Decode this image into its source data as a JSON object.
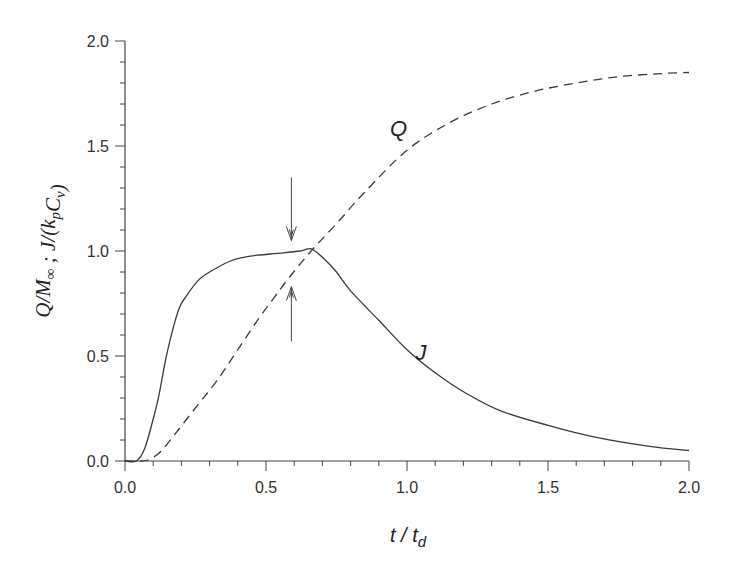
{
  "chart_data": {
    "type": "line",
    "title": "",
    "xlabel": "t / t_d",
    "xlabel_parts": {
      "main": "t / t",
      "sub": "d"
    },
    "ylabel": "Q/M∞ ; J/(k_p C_v)",
    "ylabel_parts": [
      {
        "text": "Q/M",
        "sub": "∞"
      },
      {
        "text": " ; J/(k",
        "sub": "p"
      },
      {
        "text": "C",
        "sub": "v"
      },
      {
        "text": ")",
        "sub": ""
      }
    ],
    "xlim": [
      0.0,
      2.0
    ],
    "ylim": [
      0.0,
      2.0
    ],
    "x_ticks": [
      "0.0",
      "0.5",
      "1.0",
      "1.5",
      "2.0"
    ],
    "y_ticks": [
      "0.0",
      "0.5",
      "1.0",
      "1.5",
      "2.0"
    ],
    "x_tick_values": [
      0.0,
      0.5,
      1.0,
      1.5,
      2.0
    ],
    "y_tick_values": [
      0.0,
      0.5,
      1.0,
      1.5,
      2.0
    ],
    "minor_step": 0.1,
    "grid": false,
    "legend": "none",
    "series": [
      {
        "name": "J",
        "style": "solid",
        "x": [
          0.0,
          0.04,
          0.07,
          0.1,
          0.12,
          0.15,
          0.19,
          0.22,
          0.26,
          0.3,
          0.37,
          0.42,
          0.47,
          0.55,
          0.62,
          0.66,
          0.7,
          0.75,
          0.8,
          0.9,
          1.0,
          1.1,
          1.2,
          1.33,
          1.5,
          1.68,
          1.86,
          2.0
        ],
        "values": [
          0.0,
          0.0,
          0.06,
          0.2,
          0.31,
          0.52,
          0.72,
          0.79,
          0.86,
          0.9,
          0.95,
          0.97,
          0.98,
          0.99,
          1.0,
          1.01,
          0.97,
          0.9,
          0.81,
          0.67,
          0.53,
          0.42,
          0.33,
          0.24,
          0.17,
          0.11,
          0.07,
          0.05
        ]
      },
      {
        "name": "Q",
        "style": "dashed",
        "x": [
          0.0,
          0.06,
          0.09,
          0.13,
          0.19,
          0.26,
          0.33,
          0.4,
          0.47,
          0.53,
          0.58,
          0.66,
          0.75,
          0.85,
          1.0,
          1.15,
          1.3,
          1.45,
          1.6,
          1.75,
          1.9,
          2.0
        ],
        "values": [
          0.0,
          0.0,
          0.01,
          0.05,
          0.15,
          0.27,
          0.39,
          0.53,
          0.67,
          0.78,
          0.87,
          1.0,
          1.13,
          1.28,
          1.48,
          1.61,
          1.7,
          1.76,
          1.8,
          1.83,
          1.845,
          1.85
        ]
      }
    ],
    "annotations": [
      {
        "type": "label",
        "text": "Q",
        "x": 0.94,
        "y": 1.55
      },
      {
        "type": "label",
        "text": "J",
        "x": 1.03,
        "y": 0.48
      },
      {
        "type": "arrow",
        "direction": "down",
        "x": 0.59,
        "from": 1.35,
        "to": 1.05
      },
      {
        "type": "arrow",
        "direction": "up",
        "x": 0.59,
        "from": 0.57,
        "to": 0.83
      }
    ]
  }
}
